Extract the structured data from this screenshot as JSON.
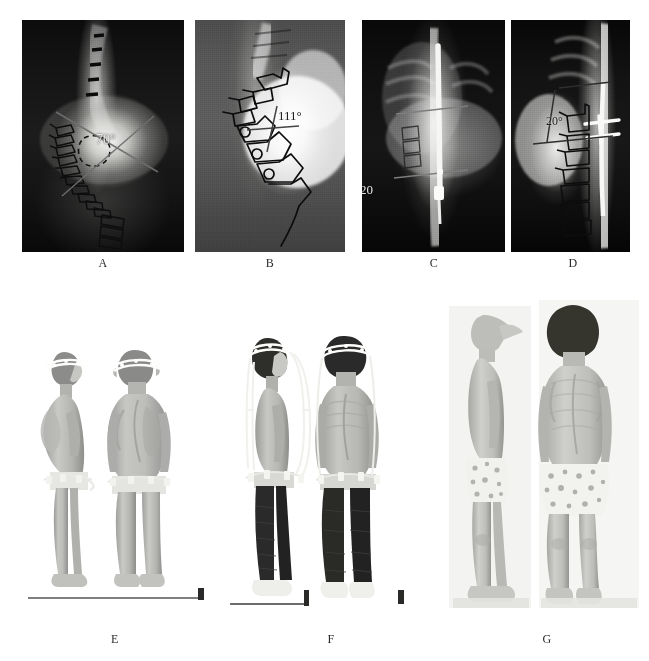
{
  "figure": {
    "background_color": "#ffffff",
    "panel_count": 7,
    "label_color": "#2a2a2a"
  },
  "panels": [
    {
      "id": "A",
      "label": "A",
      "type": "radiograph",
      "view": "anteroposterior",
      "annotation": "70°",
      "annotation_value": 70,
      "annotation_unit": "degrees",
      "measurement": "Cobb angle",
      "overlay": "traced vertebral outlines with crossing Cobb measurement lines and dashed apical vertebra"
    },
    {
      "id": "B",
      "label": "B",
      "type": "radiograph",
      "view": "lateral",
      "annotation": "111°",
      "annotation_value": 111,
      "annotation_unit": "degrees",
      "measurement": "kyphosis angle",
      "overlay": "traced vertebral bodies along kyphotic apex with angle lines"
    },
    {
      "id": "C",
      "label": "C",
      "type": "radiograph",
      "view": "anteroposterior",
      "annotation": "20",
      "annotation_value": 20,
      "annotation_unit": "degrees",
      "measurement": "post-instrumentation Cobb angle",
      "overlay": "posterior instrumentation rod with end-plate reference lines"
    },
    {
      "id": "D",
      "label": "D",
      "type": "radiograph",
      "view": "lateral",
      "annotation": "20°",
      "annotation_value": 20,
      "annotation_unit": "degrees",
      "measurement": "post-instrumentation kyphosis angle",
      "overlay": "instrumentation rod with traced vertebrae and angle lines"
    },
    {
      "id": "E",
      "label": "E",
      "type": "clinical-photograph",
      "views": [
        "lateral",
        "posterior"
      ],
      "device": "halo ring",
      "scale_bar": true
    },
    {
      "id": "F",
      "label": "F",
      "type": "clinical-photograph",
      "views": [
        "lateral",
        "posterior"
      ],
      "device": "halo-pelvic traction frame",
      "scale_bar": true
    },
    {
      "id": "G",
      "label": "G",
      "type": "clinical-photograph",
      "views": [
        "lateral",
        "posterior"
      ],
      "device": "none",
      "scale_bar": false
    }
  ],
  "annotations": {
    "a_angle": "70°",
    "b_angle": "111°",
    "c_angle": "20",
    "d_angle": "20°"
  },
  "labels": {
    "a": "A",
    "b": "B",
    "c": "C",
    "d": "D",
    "e": "E",
    "f": "F",
    "g": "G"
  }
}
